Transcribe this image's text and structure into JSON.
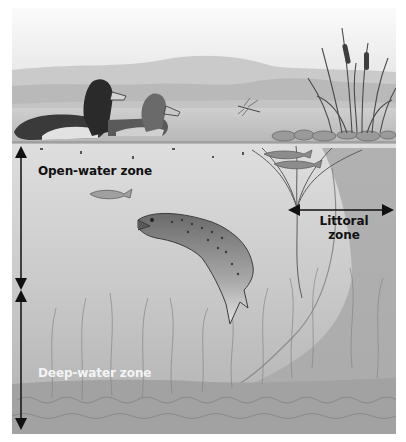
{
  "diagram": {
    "zones": [
      {
        "id": "open-water",
        "label": "Open-water zone",
        "color": "#111111"
      },
      {
        "id": "littoral",
        "label_line1": "Littoral",
        "label_line2": "zone",
        "color": "#111111"
      },
      {
        "id": "deep-water",
        "label": "Deep-water zone",
        "color": "#f4f4f4"
      }
    ],
    "illustration_elements": [
      "sky",
      "distant-hills",
      "lake-surface",
      "ring-necked-duck-male",
      "ring-necked-duck-female",
      "dragonfly",
      "cattails-reeds",
      "shoreline-rocks",
      "small-minnows",
      "small-fish",
      "brown-trout",
      "underwater-plants",
      "lake-bottom-sediment",
      "littoral-slope"
    ],
    "colors": {
      "sky_top": "#f7f7f7",
      "hills_far": "#c6c6c6",
      "hills_near": "#b4b4b4",
      "water_surface": "#bdbdbd",
      "water_upper": "#dadada",
      "water_lower": "#b3b3b3",
      "bottom": "#a7a7a7",
      "arrow": "#111111"
    }
  }
}
